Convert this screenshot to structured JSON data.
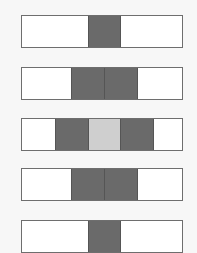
{
  "diagram": {
    "colors": {
      "white": "#ffffff",
      "dark": "#6a6a6a",
      "light": "#cfcfcf",
      "border": "#6e6e6e",
      "background": "#f7f7f7"
    },
    "rows": [
      {
        "top": 15,
        "cells": [
          "white-double",
          "dark",
          "white-double"
        ]
      },
      {
        "top": 67,
        "cells": [
          "white-1.5",
          "dark",
          "dark",
          "white-1.5"
        ]
      },
      {
        "top": 118,
        "cells": [
          "white",
          "dark",
          "light",
          "dark",
          "white"
        ]
      },
      {
        "top": 168,
        "cells": [
          "white-1.5",
          "dark",
          "dark",
          "white-1.5"
        ]
      },
      {
        "top": 220,
        "cells": [
          "white-double",
          "dark",
          "white-double"
        ]
      }
    ]
  }
}
